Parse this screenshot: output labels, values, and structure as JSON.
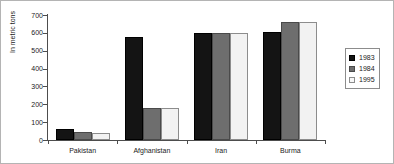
{
  "chart_data": {
    "type": "bar",
    "title": "",
    "subtitle": "",
    "xlabel": "",
    "ylabel": "In metric tons",
    "ylim": [
      0,
      700
    ],
    "ytick_labels": [
      "700",
      "600",
      "500",
      "400",
      "300",
      "200",
      "100",
      "0"
    ],
    "ytick_values": [
      700,
      600,
      500,
      400,
      300,
      200,
      100,
      0
    ],
    "grid": false,
    "legend_position": "right",
    "categories": [
      "Pakistan",
      "Afghanistan",
      "Iran",
      "Burma"
    ],
    "series": [
      {
        "name": "1983",
        "color": "#141414",
        "values": [
          60,
          575,
          600,
          605
        ]
      },
      {
        "name": "1984",
        "color": "#6e6e6e",
        "values": [
          45,
          180,
          600,
          660
        ]
      },
      {
        "name": "1995",
        "color": "#f2f2f2",
        "values": [
          38,
          180,
          600,
          660
        ]
      }
    ]
  },
  "legend": {
    "items": [
      {
        "label": "1983",
        "swatch": "legend-swatch-1983"
      },
      {
        "label": "1984",
        "swatch": "legend-swatch-1984"
      },
      {
        "label": "1995",
        "swatch": "legend-swatch-1995"
      }
    ]
  },
  "axes": {
    "y_title": "In metric tons"
  }
}
